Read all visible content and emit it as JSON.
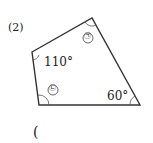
{
  "problem": {
    "number": "(2)",
    "answer_paren": "("
  },
  "diagram": {
    "shape": "quadrilateral",
    "vertices": [
      [
        32,
        52
      ],
      [
        92,
        18
      ],
      [
        140,
        105
      ],
      [
        39,
        105
      ]
    ],
    "angles": {
      "top_left": "110°",
      "top_right_marker": "㉠",
      "bottom_left_marker": "㉡",
      "bottom_right": "60°"
    },
    "stroke_color": "#333333"
  }
}
